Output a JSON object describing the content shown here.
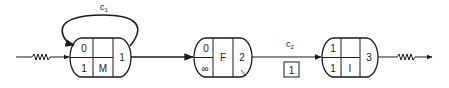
{
  "diagram": {
    "type": "state-flow",
    "colors": {
      "ink": "#1a1a1a",
      "background": "#ffffff"
    },
    "input": {
      "icon": "resistor-squiggle-icon"
    },
    "output": {
      "icon": "resistor-squiggle-icon"
    },
    "nodes": [
      {
        "id": "M",
        "top_left": "0",
        "bottom_left": "1",
        "center_label": "M",
        "right": "1"
      },
      {
        "id": "F",
        "top_left": "0",
        "bottom_left": "∞",
        "center_label": "F",
        "right": "2"
      },
      {
        "id": "I",
        "top_left": "1",
        "bottom_left": "1",
        "center_label": "I",
        "right": "3"
      }
    ],
    "edges": [
      {
        "label_main": "c",
        "label_sub": "1",
        "type": "self-loop on M"
      },
      {
        "label_main": "c",
        "label_sub": "2",
        "type": "F to I",
        "box_value": "1"
      }
    ]
  }
}
